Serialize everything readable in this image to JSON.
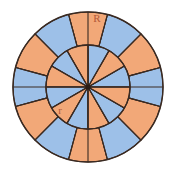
{
  "figure": {
    "type": "geometry-diagram",
    "background_color": "#ffffff",
    "stroke_color": "#3a2a22",
    "stroke_width": 1.1,
    "colors": {
      "orange": "#f2a878",
      "blue": "#9dc0e8",
      "outline": "#3a2a22",
      "label": "#c0603a"
    },
    "center": {
      "x": 88,
      "y": 87
    },
    "outer_radius": 75,
    "inner_radius": 42,
    "sector_count": 12,
    "sector_angle_deg": 30,
    "outer_ring_offset_deg": 15,
    "inner_start_color": "blue",
    "outer_start_color": "orange",
    "center_dot_radius": 2.6,
    "diameter_lines": [
      {
        "name": "horizontal-diameter",
        "angle_deg": 0
      },
      {
        "name": "vertical-diameter",
        "angle_deg": 90
      }
    ],
    "labels": [
      {
        "name": "outer-radius-label",
        "text": "R",
        "x": 97,
        "y": 22,
        "color": "#c0603a"
      },
      {
        "name": "inner-radius-label",
        "text": "r",
        "x": 60,
        "y": 114,
        "color": "#c0603a"
      }
    ]
  }
}
